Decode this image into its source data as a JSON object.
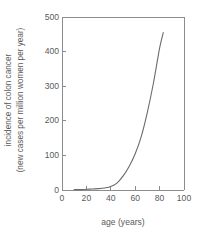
{
  "chart_data": {
    "type": "line",
    "title": "",
    "xlabel": "age (years)",
    "ylabel_line1": "incidence of colon cancer",
    "ylabel_line2": "(new cases per million women per year)",
    "xlim": [
      0,
      100
    ],
    "ylim": [
      0,
      500
    ],
    "xticks": [
      0,
      20,
      40,
      60,
      80,
      100
    ],
    "yticks": [
      0,
      100,
      200,
      300,
      400,
      500
    ],
    "xtick_labels": [
      "0",
      "20",
      "40",
      "60",
      "80",
      "100"
    ],
    "ytick_labels": [
      "0",
      "100",
      "200",
      "300",
      "400",
      "500"
    ],
    "grid": false,
    "legend": "none",
    "series": [
      {
        "name": "colon cancer incidence in women",
        "x": [
          10,
          15,
          20,
          25,
          30,
          35,
          40,
          45,
          50,
          55,
          60,
          65,
          70,
          75,
          80,
          83
        ],
        "y": [
          1,
          1,
          2,
          3,
          4,
          6,
          10,
          20,
          40,
          68,
          105,
          155,
          225,
          310,
          410,
          455
        ]
      }
    ],
    "line_color": "#6b6b6b",
    "axis_color": "#8c8c8c",
    "background": "#ffffff"
  }
}
